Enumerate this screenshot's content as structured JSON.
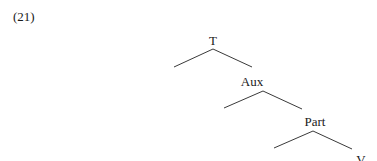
{
  "example": {
    "number": "(21)"
  },
  "tree": {
    "nodes": [
      {
        "id": "T",
        "label": "T",
        "x": 213,
        "y": 34
      },
      {
        "id": "Aux",
        "label": "Aux",
        "x": 252,
        "y": 75
      },
      {
        "id": "Part",
        "label": "Part",
        "x": 315,
        "y": 115
      },
      {
        "id": "V",
        "label": "V",
        "x": 361,
        "y": 153
      }
    ],
    "edges": [
      {
        "from": "T",
        "x1": 213,
        "y1": 49,
        "x2": 174,
        "y2": 67,
        "side": "left"
      },
      {
        "from": "T",
        "to": "Aux",
        "x1": 213,
        "y1": 49,
        "x2": 252,
        "y2": 67,
        "side": "right"
      },
      {
        "from": "Aux",
        "x1": 263,
        "y1": 91,
        "x2": 224,
        "y2": 108,
        "side": "left"
      },
      {
        "from": "Aux",
        "to": "Part",
        "x1": 263,
        "y1": 91,
        "x2": 302,
        "y2": 109,
        "side": "right"
      },
      {
        "from": "Part",
        "x1": 313,
        "y1": 131,
        "x2": 274,
        "y2": 148,
        "side": "left"
      },
      {
        "from": "Part",
        "to": "V",
        "x1": 313,
        "y1": 131,
        "x2": 352,
        "y2": 149,
        "side": "right"
      }
    ]
  }
}
